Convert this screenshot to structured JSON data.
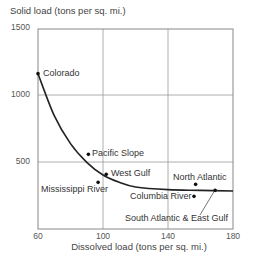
{
  "chart_data": {
    "type": "scatter",
    "title": "",
    "xlabel": "Dissolved load (tons per sq. mi.)",
    "ylabel": "Solid load (tons per sq. mi.)",
    "xlim": [
      60,
      180
    ],
    "ylim": [
      0,
      1500
    ],
    "x_ticks": [
      "60",
      "100",
      "140",
      "180"
    ],
    "y_ticks": [
      "1500",
      "1000",
      "500"
    ],
    "grid": true,
    "legend": "none",
    "points": [
      {
        "name": "Colorado",
        "x": 60,
        "y": 1165
      },
      {
        "name": "Pacific Slope",
        "x": 91,
        "y": 560
      },
      {
        "name": "West Gulf",
        "x": 102,
        "y": 410
      },
      {
        "name": "Mississippi River",
        "x": 97,
        "y": 350
      },
      {
        "name": "North Atlantic",
        "x": 157,
        "y": 335
      },
      {
        "name": "Columbia River",
        "x": 156,
        "y": 245
      },
      {
        "name": "South Atlantic & East Gulf",
        "x": 169,
        "y": 290
      }
    ],
    "trend_curve": {
      "description": "Fitted decreasing curve from Colorado flattening toward ~285",
      "x": [
        60,
        70,
        80,
        90,
        100,
        110,
        120,
        140,
        160,
        180
      ],
      "y": [
        1165,
        850,
        640,
        500,
        405,
        350,
        315,
        295,
        290,
        285
      ]
    }
  }
}
